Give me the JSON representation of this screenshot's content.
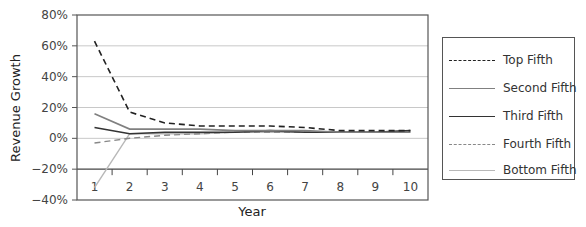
{
  "chart_data": {
    "type": "line",
    "title": "",
    "xlabel": "Year",
    "ylabel": "Revenue Growth",
    "x": [
      1,
      2,
      3,
      4,
      5,
      6,
      7,
      8,
      9,
      10
    ],
    "y_ticks": [
      "80%",
      "60%",
      "40%",
      "20%",
      "0%",
      "-20%",
      "-40%"
    ],
    "ylim": [
      -40,
      80
    ],
    "grid": true,
    "legend_position": "right",
    "series": [
      {
        "name": "Top Fifth",
        "color": "#222222",
        "dash": "6,4",
        "width": 1.6,
        "values": [
          63,
          17,
          10,
          8,
          8,
          8,
          7,
          5,
          5,
          5
        ]
      },
      {
        "name": "Second Fifth",
        "color": "#808080",
        "dash": "",
        "width": 1.6,
        "values": [
          16,
          6,
          6,
          6,
          5,
          5,
          5,
          4,
          4,
          4
        ]
      },
      {
        "name": "Third Fifth",
        "color": "#333333",
        "dash": "",
        "width": 1.6,
        "values": [
          7,
          3,
          4,
          4,
          4,
          5,
          4,
          4,
          4,
          5
        ]
      },
      {
        "name": "Fourth Fifth",
        "color": "#888888",
        "dash": "6,4",
        "width": 1.4,
        "values": [
          -3,
          0,
          2,
          3,
          4,
          4,
          4,
          4,
          4,
          5
        ]
      },
      {
        "name": "Bottom Fifth",
        "color": "#b8b8b8",
        "dash": "",
        "width": 1.4,
        "values": [
          -32,
          3,
          3,
          3,
          4,
          4,
          4,
          4,
          4,
          4
        ]
      }
    ]
  },
  "legend": {
    "items": [
      "Top Fifth",
      "Second Fifth",
      "Third Fifth",
      "Fourth Fifth",
      "Bottom Fifth"
    ]
  }
}
